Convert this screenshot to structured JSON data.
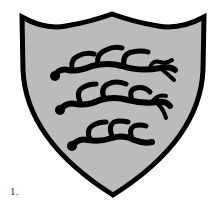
{
  "figure": {
    "caption": "1.",
    "colors": {
      "field": "#bdbdbd",
      "outline": "#000000",
      "charge": "#000000",
      "background": "#ffffff"
    },
    "antlers": [
      {
        "position": "top"
      },
      {
        "position": "middle"
      },
      {
        "position": "bottom"
      }
    ]
  }
}
